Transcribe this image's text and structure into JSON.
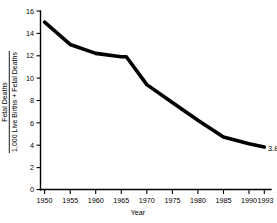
{
  "chart_data": {
    "type": "line",
    "title": "",
    "subtitle": "",
    "xlabel": "Year",
    "ylabel_numerator": "Fetal Deaths",
    "ylabel_denominator": "1,000 Live Births + Fetal Deaths",
    "ylabel": "Fetal Deaths / 1,000 Live Births + Fetal Deaths",
    "xlim": [
      1949,
      1994
    ],
    "ylim": [
      0,
      16
    ],
    "grid": false,
    "legend": null,
    "xticks": [
      "1950",
      "1955",
      "1960",
      "1965",
      "1970",
      "1975",
      "1980",
      "1985",
      "1990",
      "1993"
    ],
    "xtick_values": [
      1950,
      1955,
      1960,
      1965,
      1970,
      1975,
      1980,
      1985,
      1990,
      1993
    ],
    "yticks": [
      "0",
      "2",
      "4",
      "6",
      "8",
      "10",
      "12",
      "14",
      "16"
    ],
    "ytick_values": [
      0,
      2,
      4,
      6,
      8,
      10,
      12,
      14,
      16
    ],
    "x": [
      1950,
      1955,
      1960,
      1965,
      1966,
      1970,
      1975,
      1980,
      1985,
      1990,
      1993
    ],
    "values": [
      15.0,
      13.0,
      12.2,
      11.9,
      11.9,
      9.4,
      7.8,
      6.2,
      4.7,
      4.1,
      3.8
    ],
    "series": [
      {
        "name": "Fetal death rate",
        "values": [
          15.0,
          13.0,
          12.2,
          11.9,
          11.9,
          9.4,
          7.8,
          6.2,
          4.7,
          4.1,
          3.8
        ]
      }
    ],
    "annotations": [
      {
        "text": "3.8",
        "x": 1993,
        "y": 3.8
      }
    ]
  }
}
